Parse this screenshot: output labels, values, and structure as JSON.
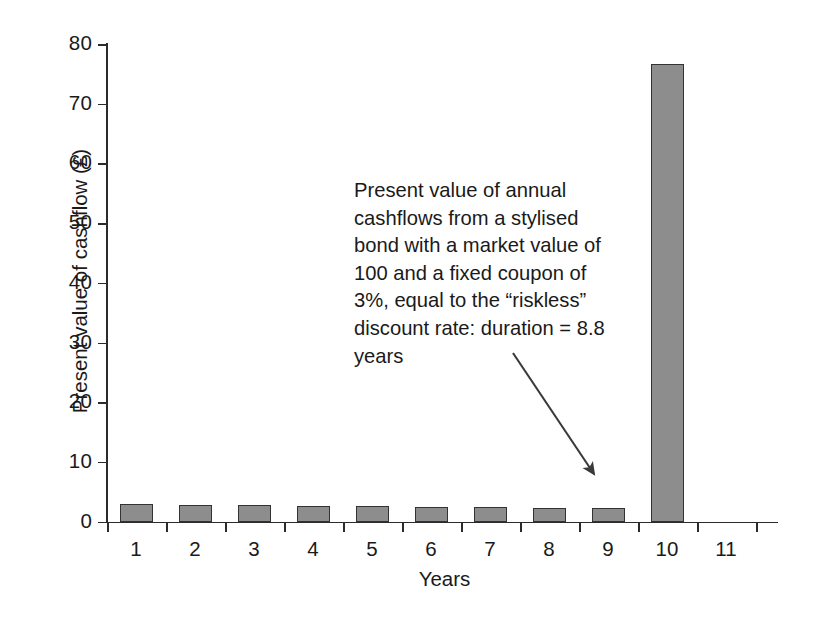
{
  "chart_data": {
    "type": "bar",
    "title": "",
    "xlabel": "Years",
    "ylabel": "Present value of cashflow (£)",
    "categories": [
      "1",
      "2",
      "3",
      "4",
      "5",
      "6",
      "7",
      "8",
      "9",
      "10"
    ],
    "values": [
      2.91,
      2.83,
      2.75,
      2.66,
      2.58,
      2.5,
      2.42,
      2.33,
      2.25,
      76.6
    ],
    "x_tick_labels": [
      "1",
      "2",
      "3",
      "4",
      "5",
      "6",
      "7",
      "8",
      "9",
      "10",
      "11"
    ],
    "y_tick_labels": [
      "0",
      "10",
      "20",
      "30",
      "40",
      "50",
      "60",
      "70",
      "80"
    ],
    "y_tick_values": [
      0,
      10,
      20,
      30,
      40,
      50,
      60,
      70,
      80
    ],
    "ylim": [
      0,
      80
    ],
    "xlim": [
      0,
      11.6
    ],
    "grid": false,
    "legend": "none",
    "bar_color": "#8d8d8d",
    "bar_edge_color": "#333333",
    "axis_color": "#2b2b2b",
    "annotation": {
      "text": "Present value of annual cashflows from a stylised bond with a market value of 100 and a fixed coupon of 3%, equal to the “riskless” discount rate: duration = 8.8 years",
      "arrow_from": [
        513,
        353
      ],
      "arrow_to": [
        601,
        484
      ]
    }
  }
}
